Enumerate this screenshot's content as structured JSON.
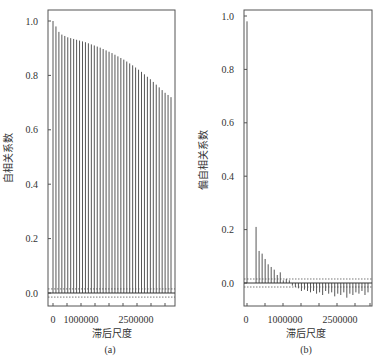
{
  "chart_data": [
    {
      "panel": "a",
      "type": "bar",
      "subtype": "stem (autocorrelation)",
      "caption": "(a)",
      "xlabel": "滞后尺度",
      "ylabel": "自相关系数",
      "x_ticks": [
        "0",
        "1000000",
        "2500000"
      ],
      "y_ticks": [
        "0.0",
        "0.2",
        "0.4",
        "0.6",
        "0.8",
        "1.0"
      ],
      "ylim": [
        -0.05,
        1.03
      ],
      "confidence_band": [
        -0.015,
        0.015
      ],
      "values": [
        1.0,
        0.98,
        0.96,
        0.95,
        0.945,
        0.94,
        0.937,
        0.934,
        0.931,
        0.928,
        0.925,
        0.922,
        0.918,
        0.914,
        0.91,
        0.906,
        0.902,
        0.897,
        0.892,
        0.887,
        0.882,
        0.876,
        0.87,
        0.864,
        0.858,
        0.851,
        0.844,
        0.837,
        0.829,
        0.821,
        0.813,
        0.804,
        0.795,
        0.786,
        0.776,
        0.766,
        0.756,
        0.746,
        0.736,
        0.728,
        0.72
      ]
    },
    {
      "panel": "b",
      "type": "bar",
      "subtype": "stem (partial autocorrelation)",
      "caption": "(b)",
      "xlabel": "滞后尺度",
      "ylabel": "偏自相关系数",
      "x_ticks": [
        "0",
        "1000000",
        "2500000"
      ],
      "y_ticks": [
        "0.0",
        "0.2",
        "0.4",
        "0.6",
        "0.8",
        "1.0"
      ],
      "ylim": [
        -0.12,
        1.03
      ],
      "confidence_band": [
        -0.015,
        0.015
      ],
      "values": [
        0.98,
        0.0,
        0.0,
        0.21,
        0.12,
        0.11,
        0.09,
        0.07,
        0.06,
        0.05,
        0.03,
        0.04,
        0.01,
        0.015,
        0.01,
        -0.01,
        -0.015,
        -0.02,
        -0.03,
        -0.025,
        -0.03,
        -0.035,
        -0.03,
        -0.04,
        -0.035,
        -0.045,
        -0.03,
        -0.04,
        -0.035,
        -0.05,
        -0.04,
        -0.045,
        -0.035,
        -0.055,
        -0.04,
        -0.045,
        -0.035,
        -0.04,
        -0.03,
        -0.045,
        -0.035
      ]
    }
  ],
  "panels": {
    "a": {
      "caption": "(a)",
      "xlabel": "滞后尺度",
      "ylabel": "自相关系数",
      "xtick0": "0",
      "xtick1": "1000000",
      "xtick2": "2500000"
    },
    "b": {
      "caption": "(b)",
      "xlabel": "滞后尺度",
      "ylabel": "偏自相关系数",
      "xtick0": "0",
      "xtick1": "1000000",
      "xtick2": "2500000"
    }
  }
}
